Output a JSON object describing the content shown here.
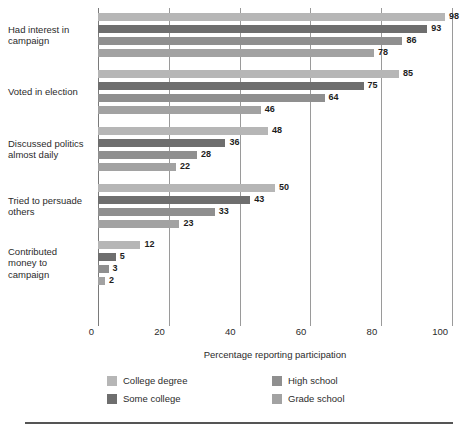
{
  "chart_data": {
    "type": "bar",
    "orientation": "horizontal",
    "title": "",
    "xlabel": "Percentage reporting participation",
    "ylabel": "",
    "xlim": [
      0,
      100
    ],
    "xticks": [
      0,
      20,
      40,
      60,
      80,
      100
    ],
    "grid": true,
    "legend_position": "bottom",
    "categories": [
      "Had interest in campaign",
      "Voted in election",
      "Discussed politics almost daily",
      "Tried to persuade others",
      "Contributed money to campaign"
    ],
    "category_label_lines": [
      [
        "Had interest in",
        "campaign"
      ],
      [
        "Voted in election"
      ],
      [
        "Discussed politics",
        "almost daily"
      ],
      [
        "Tried to persuade",
        "others"
      ],
      [
        "Contributed",
        "money to",
        "campaign"
      ]
    ],
    "series": [
      {
        "name": "College degree",
        "color": "#b6b6b6",
        "values": [
          98,
          85,
          48,
          50,
          12
        ]
      },
      {
        "name": "Some college",
        "color": "#6e6e6e",
        "values": [
          93,
          75,
          36,
          43,
          5
        ]
      },
      {
        "name": "High school",
        "color": "#8f8f8f",
        "values": [
          86,
          64,
          28,
          33,
          3
        ]
      },
      {
        "name": "Grade school",
        "color": "#a2a2a2",
        "values": [
          78,
          46,
          22,
          23,
          2
        ]
      }
    ]
  },
  "legend": {
    "items": [
      {
        "label": "College degree",
        "color": "#b6b6b6"
      },
      {
        "label": "Some college",
        "color": "#6e6e6e"
      },
      {
        "label": "High school",
        "color": "#8f8f8f"
      },
      {
        "label": "Grade school",
        "color": "#a2a2a2"
      }
    ]
  },
  "axis": {
    "tick_labels": [
      "0",
      "20",
      "40",
      "60",
      "80",
      "100"
    ],
    "title": "Percentage reporting participation"
  }
}
